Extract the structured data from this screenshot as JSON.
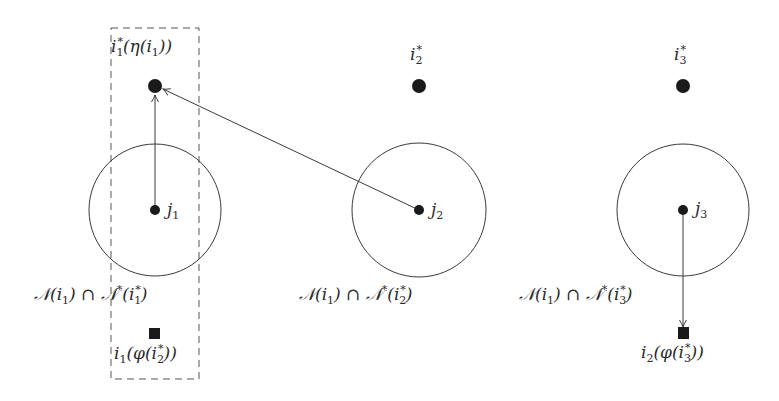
{
  "colors": {
    "stroke": "#3a3a3a",
    "node_fill": "#1a1a1a",
    "label": "#2a2a2a",
    "dashed_box": "#555555"
  },
  "diagram": {
    "groups": [
      {
        "id": "group-1",
        "circle": {
          "cx": 155,
          "cy": 210,
          "r": 66
        },
        "center_node": {
          "cx": 155,
          "cy": 210,
          "label_base": "j",
          "label_sub": "1"
        },
        "top_node": {
          "cx": 155,
          "cy": 86,
          "label": "i₁*(η(i₁))"
        },
        "neighborhood_label": "𝒩(i₁) ∩ 𝒩*(i₁*)",
        "square_node": {
          "cx": 155,
          "cy": 334,
          "label": "i₁(φ(i₂*))"
        }
      },
      {
        "id": "group-2",
        "circle": {
          "cx": 419,
          "cy": 210,
          "r": 67
        },
        "center_node": {
          "cx": 419,
          "cy": 210,
          "label_base": "j",
          "label_sub": "2"
        },
        "top_node": {
          "cx": 419,
          "cy": 86,
          "label": "i₂*"
        },
        "neighborhood_label": "𝒩(i₁) ∩ 𝒩*(i₂*)"
      },
      {
        "id": "group-3",
        "circle": {
          "cx": 683,
          "cy": 210,
          "r": 66
        },
        "center_node": {
          "cx": 683,
          "cy": 210,
          "label_base": "j",
          "label_sub": "3"
        },
        "top_node": {
          "cx": 683,
          "cy": 86,
          "label": "i₃*"
        },
        "neighborhood_label": "𝒩(i₁) ∩ 𝒩*(i₃*)",
        "square_node": {
          "cx": 683,
          "cy": 333,
          "label": "i₂(φ(i₃*))"
        }
      }
    ],
    "edges": [
      {
        "from": "j1",
        "to": "i1*",
        "type": "arrow"
      },
      {
        "from": "j2",
        "to": "i1*",
        "type": "arrow"
      },
      {
        "from": "j3",
        "to": "i2(φ(i3*))",
        "type": "arrow"
      }
    ],
    "dashed_box": {
      "x": 111,
      "y": 28,
      "width": 88,
      "height": 351
    },
    "labels": {
      "top1": {
        "base": "i",
        "sub": "1",
        "sup": "*",
        "rest": "(η(i",
        "rest_sub": "1",
        "tail": "))"
      },
      "top2": {
        "base": "i",
        "sub": "2",
        "sup": "*"
      },
      "top3": {
        "base": "i",
        "sub": "3",
        "sup": "*"
      },
      "j1": {
        "base": "j",
        "sub": "1"
      },
      "j2": {
        "base": "j",
        "sub": "2"
      },
      "j3": {
        "base": "j",
        "sub": "3"
      },
      "n1": {
        "pre": "𝒩(i",
        "pre_sub": "1",
        "mid": ") ∩ 𝒩",
        "mid_sup": "*",
        "open": "(i",
        "sub": "1",
        "sup": "*",
        "close": ")"
      },
      "n2": {
        "pre": "𝒩(i",
        "pre_sub": "1",
        "mid": ") ∩ 𝒩",
        "mid_sup": "*",
        "open": "(i",
        "sub": "2",
        "sup": "*",
        "close": ")"
      },
      "n3": {
        "pre": "𝒩(i",
        "pre_sub": "1",
        "mid": ") ∩ 𝒩",
        "mid_sup": "*",
        "open": "(i",
        "sub": "3",
        "sup": "*",
        "close": ")"
      },
      "sq1": {
        "base": "i",
        "sub": "1",
        "rest": "(φ(i",
        "inner_sub": "2",
        "inner_sup": "*",
        "tail": "))"
      },
      "sq3": {
        "base": "i",
        "sub": "2",
        "rest": "(φ(i",
        "inner_sub": "3",
        "inner_sup": "*",
        "tail": "))"
      }
    }
  }
}
